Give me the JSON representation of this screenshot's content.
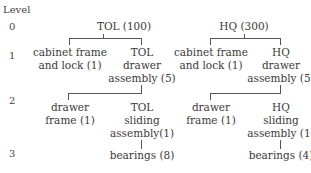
{
  "level_header": "Level",
  "levels": [
    "0",
    "1",
    "2",
    "3"
  ],
  "tree_left": {
    "root": "TOL (100)",
    "l1_left": [
      "cabinet frame",
      "and lock (1)"
    ],
    "l1_right": [
      "TOL",
      "drawer",
      "assembly (5)"
    ],
    "l2_left": [
      "drawer",
      "frame (1)"
    ],
    "l2_right": [
      "TOL",
      "sliding",
      "assembly(1)"
    ],
    "l3": "bearings (8)"
  },
  "tree_right": {
    "root": "HQ (300)",
    "l1_left": [
      "cabinet frame",
      "and lock (1)"
    ],
    "l1_right": [
      "HQ",
      "drawer",
      "assembly (5)"
    ],
    "l2_left": [
      "drawer",
      "frame (1)"
    ],
    "l2_right": [
      "HQ",
      "sliding",
      "assembly (1)"
    ],
    "l3": "bearings (4)"
  }
}
